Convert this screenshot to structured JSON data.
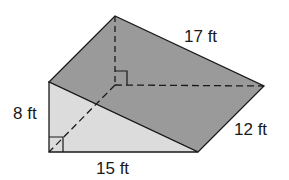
{
  "figure": {
    "type": "triangular-prism",
    "colors": {
      "top_face": "#9a9a9a",
      "front_face": "#dcdcdc",
      "edge": "#1a1a1a",
      "background": "#ffffff"
    },
    "labels": {
      "height": "8 ft",
      "base": "15 ft",
      "depth": "12 ft",
      "hypotenuse": "17 ft"
    },
    "right_angle_markers": 2
  }
}
